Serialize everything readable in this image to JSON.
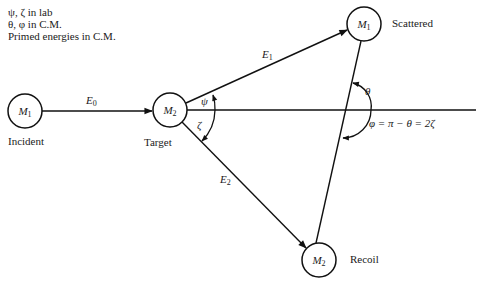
{
  "legend": {
    "lines": [
      "ψ, ζ in lab",
      "θ, φ in C.M.",
      "Primed energies in C.M."
    ]
  },
  "nodes": {
    "incident": {
      "symbol": "M",
      "sub": "1",
      "label": "Incident"
    },
    "target": {
      "symbol": "M",
      "sub": "2",
      "label": "Target"
    },
    "scattered": {
      "symbol": "M",
      "sub": "1",
      "label": "Scattered"
    },
    "recoil": {
      "symbol": "M",
      "sub": "2",
      "label": "Recoil"
    }
  },
  "edges": {
    "e0": {
      "symbol": "E",
      "sub": "0"
    },
    "e1": {
      "symbol": "E",
      "sub": "1"
    },
    "e2": {
      "symbol": "E",
      "sub": "2"
    }
  },
  "angles": {
    "psi": "ψ",
    "zeta": "ζ",
    "theta": "θ",
    "phi_relation": "φ = π − θ = 2ζ"
  }
}
